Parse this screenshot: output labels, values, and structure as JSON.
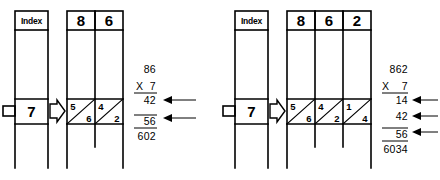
{
  "figure": {
    "ink_color": "#000000",
    "background_color": "#ffffff"
  },
  "panels": [
    {
      "id": "left-panel",
      "name": "two-digit-example",
      "index_label": "Index",
      "multiplier": "7",
      "multiplicand_digits": [
        "8",
        "6"
      ],
      "lattice_cells": [
        {
          "tens": "5",
          "ones": "6"
        },
        {
          "tens": "4",
          "ones": "2"
        }
      ],
      "arithmetic": {
        "multiplicand": "86",
        "operator": "X",
        "multiplier": "7",
        "partials": [
          "42",
          "56"
        ],
        "product": "602"
      },
      "arrow_count": 2
    },
    {
      "id": "right-panel",
      "name": "three-digit-example",
      "index_label": "Index",
      "multiplier": "7",
      "multiplicand_digits": [
        "8",
        "6",
        "2"
      ],
      "lattice_cells": [
        {
          "tens": "5",
          "ones": "6"
        },
        {
          "tens": "4",
          "ones": "2"
        },
        {
          "tens": "1",
          "ones": "4"
        }
      ],
      "arithmetic": {
        "multiplicand": "862",
        "operator": "X",
        "multiplier": "7",
        "partials": [
          "14",
          "42",
          "56"
        ],
        "product": "6034"
      },
      "arrow_count": 3
    }
  ],
  "icons": {
    "row_pointer": "hollow-right-arrow-icon",
    "partial_pointer": "solid-left-arrow-icon",
    "index_tab": "left-tab-icon"
  }
}
